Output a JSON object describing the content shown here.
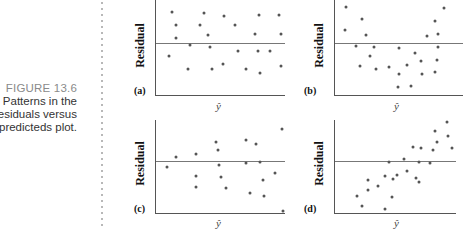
{
  "caption": {
    "figure_number": "FIGURE 13.6",
    "lines": [
      "Patterns in the",
      "residuals versus",
      "predicteds plot."
    ]
  },
  "axis_labels": {
    "y": "Residual",
    "x": "ŷ"
  },
  "chart_data": [
    {
      "type": "scatter",
      "panel": "(a)",
      "title": "",
      "xlabel": "ŷ",
      "ylabel": "Residual",
      "description": "Random scatter around zero (no pattern)",
      "grid": false,
      "zero_line": true,
      "points_px": [
        [
          16,
          12
        ],
        [
          20,
          25
        ],
        [
          20,
          38
        ],
        [
          13,
          56
        ],
        [
          34,
          45
        ],
        [
          32,
          69
        ],
        [
          44,
          25
        ],
        [
          48,
          13
        ],
        [
          52,
          35
        ],
        [
          54,
          47
        ],
        [
          56,
          69
        ],
        [
          67,
          64
        ],
        [
          68,
          16
        ],
        [
          79,
          25
        ],
        [
          82,
          51
        ],
        [
          90,
          69
        ],
        [
          99,
          34
        ],
        [
          102,
          51
        ],
        [
          103,
          15
        ],
        [
          104,
          73
        ],
        [
          114,
          51
        ],
        [
          123,
          15
        ],
        [
          125,
          34
        ],
        [
          125,
          66
        ]
      ]
    },
    {
      "type": "scatter",
      "panel": "(b)",
      "title": "",
      "xlabel": "ŷ",
      "ylabel": "Residual",
      "description": "Curved (U-shaped) pattern",
      "grid": false,
      "zero_line": true,
      "points_px": [
        [
          11,
          7
        ],
        [
          10,
          30
        ],
        [
          27,
          19
        ],
        [
          31,
          35
        ],
        [
          21,
          46
        ],
        [
          35,
          56
        ],
        [
          25,
          66
        ],
        [
          39,
          47
        ],
        [
          41,
          69
        ],
        [
          54,
          67
        ],
        [
          64,
          48
        ],
        [
          64,
          74
        ],
        [
          63,
          87
        ],
        [
          72,
          65
        ],
        [
          76,
          86
        ],
        [
          80,
          53
        ],
        [
          87,
          74
        ],
        [
          86,
          61
        ],
        [
          92,
          36
        ],
        [
          100,
          21
        ],
        [
          100,
          72
        ],
        [
          102,
          60
        ],
        [
          103,
          34
        ],
        [
          103,
          47
        ],
        [
          109,
          8
        ]
      ]
    },
    {
      "type": "scatter",
      "panel": "(c)",
      "title": "",
      "xlabel": "ŷ",
      "ylabel": "Residual",
      "description": "Fan / increasing spread pattern",
      "grid": false,
      "zero_line": true,
      "points_px": [
        [
          11,
          47
        ],
        [
          20,
          37
        ],
        [
          40,
          34
        ],
        [
          40,
          56
        ],
        [
          40,
          67
        ],
        [
          60,
          22
        ],
        [
          62,
          30
        ],
        [
          63,
          45
        ],
        [
          65,
          57
        ],
        [
          70,
          68
        ],
        [
          90,
          20
        ],
        [
          90,
          43
        ],
        [
          94,
          73
        ],
        [
          100,
          24
        ],
        [
          104,
          42
        ],
        [
          107,
          60
        ],
        [
          108,
          76
        ],
        [
          119,
          53
        ],
        [
          126,
          9
        ],
        [
          127,
          91
        ]
      ]
    },
    {
      "type": "scatter",
      "panel": "(d)",
      "title": "",
      "xlabel": "ŷ",
      "ylabel": "Residual",
      "description": "Linear (upward trend) pattern",
      "grid": false,
      "zero_line": true,
      "points_px": [
        [
          22,
          76
        ],
        [
          27,
          86
        ],
        [
          33,
          60
        ],
        [
          33,
          70
        ],
        [
          43,
          66
        ],
        [
          50,
          89
        ],
        [
          50,
          56
        ],
        [
          54,
          42
        ],
        [
          57,
          77
        ],
        [
          58,
          59
        ],
        [
          62,
          55
        ],
        [
          69,
          39
        ],
        [
          72,
          51
        ],
        [
          78,
          27
        ],
        [
          81,
          58
        ],
        [
          84,
          62
        ],
        [
          84,
          42
        ],
        [
          86,
          28
        ],
        [
          95,
          43
        ],
        [
          98,
          30
        ],
        [
          100,
          11
        ],
        [
          102,
          22
        ],
        [
          112,
          2
        ],
        [
          113,
          16
        ],
        [
          117,
          28
        ]
      ]
    }
  ],
  "panels": [
    {
      "label": "(a)"
    },
    {
      "label": "(b)"
    },
    {
      "label": "(c)"
    },
    {
      "label": "(d)"
    }
  ]
}
